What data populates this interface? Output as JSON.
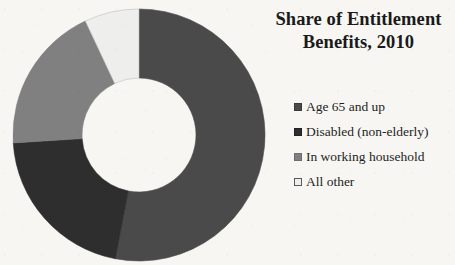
{
  "background_color": "#f7f6f3",
  "title": {
    "line1": "Share of Entitlement",
    "line2": "Benefits, 2010",
    "full": "Share of Entitlement Benefits, 2010"
  },
  "legend": {
    "position": "right",
    "items": [
      {
        "label": "Age 65 and up",
        "color": "#4a4a4a",
        "border": "#3a3a3a"
      },
      {
        "label": "Disabled (non-elderly)",
        "color": "#2e2e2e",
        "border": "#222222"
      },
      {
        "label": "In working household",
        "color": "#808080",
        "border": "#6e6e6e"
      },
      {
        "label": "All other",
        "color": "#eeeeec",
        "border": "#5a5a5a"
      }
    ]
  },
  "chart_data": {
    "type": "pie",
    "variant": "doughnut",
    "title": "Share of Entitlement Benefits, 2010",
    "xlabel": "",
    "ylabel": "",
    "units": "percent",
    "start_angle_deg": 0,
    "direction": "clockwise",
    "hole_ratio": 0.45,
    "grid": false,
    "legend_position": "right",
    "labels": [
      "Age 65 and up",
      "Disabled (non-elderly)",
      "In working household",
      "All other"
    ],
    "values": [
      53,
      21,
      19,
      7
    ],
    "colors": [
      "#4a4a4a",
      "#2e2e2e",
      "#808080",
      "#eeeeec"
    ],
    "slices": [
      {
        "label": "Age 65 and up",
        "value": 53,
        "start_deg": 0,
        "end_deg": 190.8,
        "color": "#4a4a4a"
      },
      {
        "label": "Disabled (non-elderly)",
        "value": 21,
        "start_deg": 190.8,
        "end_deg": 266.4,
        "color": "#2e2e2e"
      },
      {
        "label": "In working household",
        "value": 19,
        "start_deg": 266.4,
        "end_deg": 334.8,
        "color": "#808080"
      },
      {
        "label": "All other",
        "value": 7,
        "start_deg": 334.8,
        "end_deg": 360,
        "color": "#eeeeec"
      }
    ]
  },
  "geometry": {
    "center_x": 131,
    "center_y": 130,
    "outer_radius": 126,
    "inner_radius": 57
  }
}
